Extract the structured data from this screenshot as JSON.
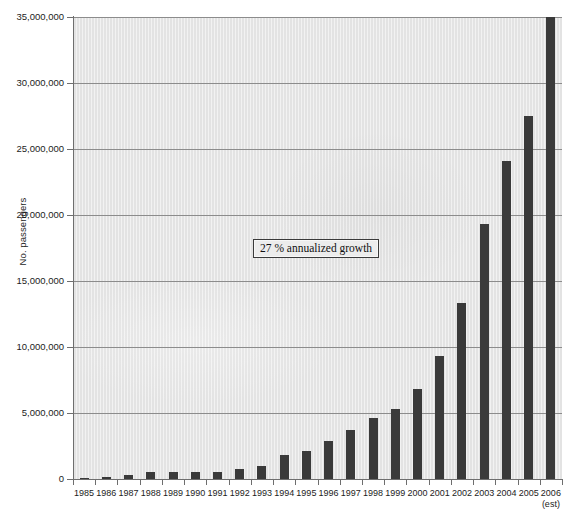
{
  "chart_data": {
    "type": "bar",
    "title": "",
    "xlabel": "",
    "ylabel": "No. passengers",
    "ylim": [
      0,
      35000000
    ],
    "ytick_values": [
      0,
      5000000,
      10000000,
      15000000,
      20000000,
      25000000,
      30000000,
      35000000
    ],
    "ytick_labels": [
      "0",
      "5,000,000",
      "10,000,000",
      "15,000,000",
      "20,000,000",
      "25,000,000",
      "30,000,000",
      "35,000,000"
    ],
    "grid": true,
    "legend": null,
    "categories": [
      "1985",
      "1986",
      "1987",
      "1988",
      "1989",
      "1990",
      "1991",
      "1992",
      "1993",
      "1994",
      "1995",
      "1996",
      "1997",
      "1998",
      "1999",
      "2000",
      "2001",
      "2002",
      "2003",
      "2004",
      "2005",
      "2006"
    ],
    "values": [
      100000,
      150000,
      300000,
      500000,
      550000,
      550000,
      500000,
      750000,
      1000000,
      1800000,
      2100000,
      2900000,
      3700000,
      4600000,
      5300000,
      6800000,
      9300000,
      13300000,
      19300000,
      24100000,
      27500000,
      35000000
    ],
    "bar_color": "#3a3a3a",
    "plot_background": "#e3e3e3",
    "axis_color": "#6e6e6e",
    "gridline_color": "#8c8c8c",
    "annotations": [
      {
        "text": "27 % annualized growth",
        "x_category": "1997",
        "y_value": 17500000
      }
    ],
    "footnotes": [
      {
        "text": "(est)",
        "applies_to_category": "2006"
      }
    ]
  },
  "axes": {
    "y_title": "No. passengers"
  },
  "scan": {
    "header_artifact": ""
  }
}
